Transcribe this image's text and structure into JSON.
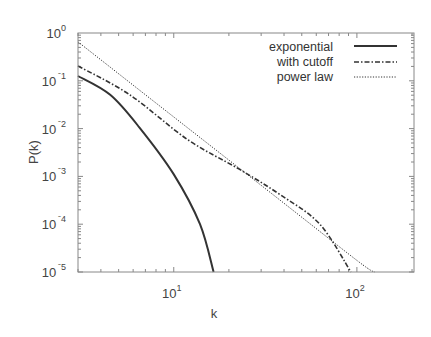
{
  "chart_data": {
    "type": "line",
    "title": "",
    "xlabel": "k",
    "ylabel": "P(k)",
    "xscale": "log",
    "yscale": "log",
    "xlim": [
      3,
      205
    ],
    "ylim": [
      1e-05,
      1
    ],
    "grid": false,
    "legend_position": "upper right",
    "x_ticks": [
      {
        "base": "10",
        "exp": "1",
        "value": 10
      },
      {
        "base": "10",
        "exp": "2",
        "value": 100
      }
    ],
    "y_ticks": [
      {
        "base": "10",
        "exp": "0",
        "value": 1
      },
      {
        "base": "10",
        "exp": "-1",
        "value": 0.1
      },
      {
        "base": "10",
        "exp": "-2",
        "value": 0.01
      },
      {
        "base": "10",
        "exp": "-3",
        "value": 0.001
      },
      {
        "base": "10",
        "exp": "-4",
        "value": 0.0001
      },
      {
        "base": "10",
        "exp": "-5",
        "value": 1e-05
      }
    ],
    "series": [
      {
        "name": "exponential",
        "style": "solid",
        "x": [
          3,
          4.5,
          6.5,
          10,
          13.9,
          16.5
        ],
        "y": [
          0.126,
          0.051,
          0.0105,
          0.0011,
          0.0001,
          1e-05
        ]
      },
      {
        "name": "with cutoff",
        "style": "dashdot",
        "x": [
          3,
          5.75,
          11.9,
          22.9,
          37.9,
          62.7,
          92.7
        ],
        "y": [
          0.204,
          0.051,
          0.0059,
          0.0014,
          0.00042,
          0.0001,
          1e-05
        ]
      },
      {
        "name": "power law",
        "style": "dotted",
        "x": [
          3,
          10,
          30,
          100,
          125
        ],
        "y": [
          0.65,
          0.0175,
          0.00065,
          1.75e-05,
          1e-05
        ]
      }
    ]
  },
  "legend": {
    "items": [
      {
        "label": "exponential",
        "style": "solid"
      },
      {
        "label": "with cutoff",
        "style": "dashdot"
      },
      {
        "label": "power law",
        "style": "dotted"
      }
    ]
  },
  "colors": {
    "line": "#333333",
    "frame": "#888888",
    "text": "#444444"
  }
}
